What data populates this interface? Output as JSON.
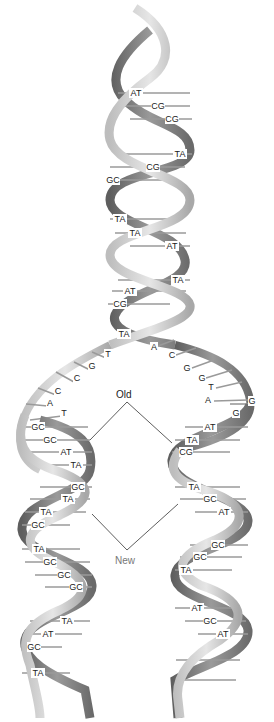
{
  "diagram": {
    "colors": {
      "ribbon_light": "#d4d4d4",
      "ribbon_mid": "#b0b0b0",
      "ribbon_dark": "#6e6e6e",
      "rung": "#9a9a9a",
      "text": "#222222",
      "old_label": "#222222",
      "new_label": "#777777"
    },
    "annotations": {
      "old": "Old",
      "new": "New"
    },
    "parent_helix": {
      "base_pairs": [
        {
          "label": "AT",
          "x": 136,
          "y": 96
        },
        {
          "label": "CG",
          "x": 158,
          "y": 109
        },
        {
          "label": "CG",
          "x": 172,
          "y": 122
        },
        {
          "label": "TA",
          "x": 180,
          "y": 157
        },
        {
          "label": "CG",
          "x": 153,
          "y": 170
        },
        {
          "label": "GC",
          "x": 113,
          "y": 183
        },
        {
          "label": "TA",
          "x": 120,
          "y": 222
        },
        {
          "label": "TA",
          "x": 135,
          "y": 236
        },
        {
          "label": "AT",
          "x": 172,
          "y": 249
        },
        {
          "label": "TA",
          "x": 178,
          "y": 283
        },
        {
          "label": "AT",
          "x": 130,
          "y": 294
        },
        {
          "label": "CG",
          "x": 120,
          "y": 307
        }
      ]
    },
    "fork": {
      "junction_pair": {
        "label": "TA",
        "x": 124,
        "y": 337
      },
      "left_strand_bases": [
        {
          "label": "T",
          "x": 108,
          "y": 357
        },
        {
          "label": "G",
          "x": 92,
          "y": 369
        },
        {
          "label": "C",
          "x": 77,
          "y": 381
        },
        {
          "label": "C",
          "x": 58,
          "y": 394
        },
        {
          "label": "A",
          "x": 50,
          "y": 406
        },
        {
          "label": "T",
          "x": 64,
          "y": 416
        }
      ],
      "right_strand_bases": [
        {
          "label": "A",
          "x": 154,
          "y": 350
        },
        {
          "label": "C",
          "x": 172,
          "y": 358
        },
        {
          "label": "G",
          "x": 187,
          "y": 371
        },
        {
          "label": "G",
          "x": 202,
          "y": 381
        },
        {
          "label": "T",
          "x": 211,
          "y": 390
        },
        {
          "label": "A",
          "x": 208,
          "y": 403
        },
        {
          "label": "G",
          "x": 252,
          "y": 404
        },
        {
          "label": "G",
          "x": 236,
          "y": 416
        }
      ]
    },
    "left_daughter": {
      "base_pairs": [
        {
          "label": "GC",
          "x": 38,
          "y": 430
        },
        {
          "label": "GC",
          "x": 50,
          "y": 443
        },
        {
          "label": "AT",
          "x": 66,
          "y": 455
        },
        {
          "label": "TA",
          "x": 76,
          "y": 468
        },
        {
          "label": "GC",
          "x": 78,
          "y": 490
        },
        {
          "label": "TA",
          "x": 68,
          "y": 502
        },
        {
          "label": "TA",
          "x": 46,
          "y": 515
        },
        {
          "label": "GC",
          "x": 38,
          "y": 528
        },
        {
          "label": "TA",
          "x": 39,
          "y": 552
        },
        {
          "label": "GC",
          "x": 50,
          "y": 565
        },
        {
          "label": "GC",
          "x": 64,
          "y": 578
        },
        {
          "label": "GC",
          "x": 76,
          "y": 590
        },
        {
          "label": "TA",
          "x": 67,
          "y": 624
        },
        {
          "label": "AT",
          "x": 48,
          "y": 637
        },
        {
          "label": "GC",
          "x": 34,
          "y": 650
        },
        {
          "label": "TA",
          "x": 38,
          "y": 676
        }
      ]
    },
    "right_daughter": {
      "base_pairs": [
        {
          "label": "AT",
          "x": 210,
          "y": 430
        },
        {
          "label": "TA",
          "x": 192,
          "y": 443
        },
        {
          "label": "CG",
          "x": 186,
          "y": 455
        },
        {
          "label": "TA",
          "x": 194,
          "y": 490
        },
        {
          "label": "GC",
          "x": 210,
          "y": 502
        },
        {
          "label": "AT",
          "x": 224,
          "y": 515
        },
        {
          "label": "GC",
          "x": 218,
          "y": 548
        },
        {
          "label": "GC",
          "x": 200,
          "y": 560
        },
        {
          "label": "TA",
          "x": 186,
          "y": 573
        },
        {
          "label": "AT",
          "x": 197,
          "y": 611
        },
        {
          "label": "GC",
          "x": 210,
          "y": 624
        },
        {
          "label": "AT",
          "x": 223,
          "y": 637
        }
      ]
    }
  }
}
